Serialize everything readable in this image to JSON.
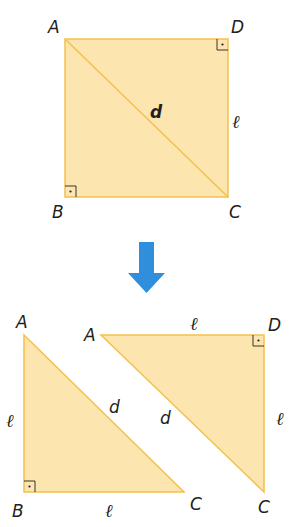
{
  "colors": {
    "fill": "#fde5b0",
    "stroke": "#f2c14e",
    "arrow": "#2f8fdc",
    "text": "#231f20"
  },
  "square": {
    "vertices": {
      "A": "A",
      "B": "B",
      "C": "C",
      "D": "D"
    },
    "diagonal_label": "d",
    "side_label": "ℓ"
  },
  "arrow": {
    "icon": "down-arrow-icon"
  },
  "triangle_left": {
    "vertices": {
      "A": "A",
      "B": "B",
      "C": "C"
    },
    "hypotenuse_label": "d",
    "leg_vertical_label": "ℓ",
    "leg_horizontal_label": "ℓ"
  },
  "triangle_right": {
    "vertices": {
      "A": "A",
      "D": "D",
      "C": "C"
    },
    "hypotenuse_label": "d",
    "leg_top_label": "ℓ",
    "leg_vertical_label": "ℓ"
  }
}
